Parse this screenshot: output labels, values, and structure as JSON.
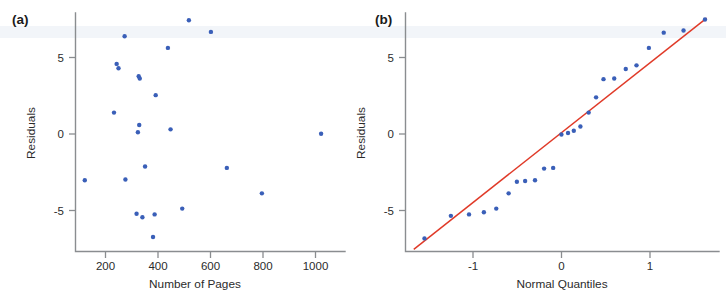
{
  "figure": {
    "width": 726,
    "height": 293,
    "background": "#ffffff",
    "point_color": "#3a5fb8",
    "line_color": "#e03a28",
    "axis_color": "#8a8d90",
    "text_color": "#2b2b2b"
  },
  "panels": [
    {
      "id": "a",
      "label": "(a)"
    },
    {
      "id": "b",
      "label": "(b)"
    }
  ],
  "chart_data": [
    {
      "type": "scatter",
      "panel": "(a)",
      "title": "",
      "xlabel": "Number of Pages",
      "ylabel": "Residuals",
      "xlim": [
        60,
        1075
      ],
      "ylim": [
        -8.2,
        8.2
      ],
      "xticks": [
        200,
        400,
        600,
        800,
        1000
      ],
      "xticklabels": [
        "200",
        "400",
        "600",
        "800",
        "1000"
      ],
      "yticks": [
        5,
        0,
        -5
      ],
      "yticklabels": [
        "5",
        "0",
        "-5"
      ],
      "grid": false,
      "legend": false,
      "points": [
        {
          "x": 95,
          "y": -3.3
        },
        {
          "x": 205,
          "y": 1.35
        },
        {
          "x": 215,
          "y": 4.7
        },
        {
          "x": 222,
          "y": 4.4
        },
        {
          "x": 245,
          "y": 6.6
        },
        {
          "x": 248,
          "y": -3.25
        },
        {
          "x": 290,
          "y": -5.6
        },
        {
          "x": 295,
          "y": 0.0
        },
        {
          "x": 298,
          "y": 3.85
        },
        {
          "x": 302,
          "y": 3.7
        },
        {
          "x": 300,
          "y": 0.5
        },
        {
          "x": 312,
          "y": -5.85
        },
        {
          "x": 322,
          "y": -2.35
        },
        {
          "x": 352,
          "y": -7.2
        },
        {
          "x": 358,
          "y": -5.65
        },
        {
          "x": 362,
          "y": 2.55
        },
        {
          "x": 408,
          "y": 5.8
        },
        {
          "x": 418,
          "y": 0.2
        },
        {
          "x": 462,
          "y": -5.25
        },
        {
          "x": 487,
          "y": 7.7
        },
        {
          "x": 570,
          "y": 6.9
        },
        {
          "x": 630,
          "y": -2.45
        },
        {
          "x": 762,
          "y": -4.2
        },
        {
          "x": 985,
          "y": -0.1
        }
      ]
    },
    {
      "type": "scatter",
      "panel": "(b)",
      "title": "",
      "xlabel": "Normal Quantiles",
      "ylabel": "Residuals",
      "xlim": [
        -1.95,
        1.85
      ],
      "ylim": [
        -8.2,
        8.2
      ],
      "xticks": [
        -1,
        0,
        1
      ],
      "xticklabels": [
        "-1",
        "0",
        "1"
      ],
      "yticks": [
        5,
        0,
        -5
      ],
      "yticklabels": [
        "5",
        "0",
        "-5"
      ],
      "grid": false,
      "legend": false,
      "reference_line": {
        "x1": -1.85,
        "y1": -8.05,
        "x2": 1.7,
        "y2": 7.85
      },
      "points": [
        {
          "x": -1.72,
          "y": -7.3
        },
        {
          "x": -1.4,
          "y": -5.75
        },
        {
          "x": -1.18,
          "y": -5.65
        },
        {
          "x": -1.0,
          "y": -5.5
        },
        {
          "x": -0.85,
          "y": -5.25
        },
        {
          "x": -0.7,
          "y": -4.2
        },
        {
          "x": -0.6,
          "y": -3.4
        },
        {
          "x": -0.5,
          "y": -3.35
        },
        {
          "x": -0.38,
          "y": -3.3
        },
        {
          "x": -0.27,
          "y": -2.5
        },
        {
          "x": -0.16,
          "y": -2.45
        },
        {
          "x": -0.06,
          "y": -0.15
        },
        {
          "x": 0.02,
          "y": -0.05
        },
        {
          "x": 0.09,
          "y": 0.1
        },
        {
          "x": 0.17,
          "y": 0.4
        },
        {
          "x": 0.27,
          "y": 1.35
        },
        {
          "x": 0.36,
          "y": 2.4
        },
        {
          "x": 0.45,
          "y": 3.65
        },
        {
          "x": 0.58,
          "y": 3.7
        },
        {
          "x": 0.72,
          "y": 4.35
        },
        {
          "x": 0.85,
          "y": 4.6
        },
        {
          "x": 1.0,
          "y": 5.8
        },
        {
          "x": 1.18,
          "y": 6.85
        },
        {
          "x": 1.42,
          "y": 7.0
        },
        {
          "x": 1.68,
          "y": 7.75
        }
      ]
    }
  ]
}
